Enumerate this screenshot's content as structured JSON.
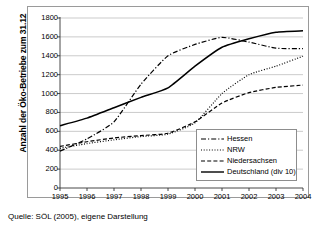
{
  "chart_data": {
    "type": "line",
    "title": "",
    "xlabel": "",
    "ylabel": "Anzahl der Öko-Betriebe zum 31.12",
    "x": [
      "1995",
      "1996",
      "1997",
      "1998",
      "1999",
      "2000",
      "2001",
      "2002",
      "2003",
      "2004"
    ],
    "categories": [
      "1995",
      "1996",
      "1997",
      "1998",
      "1999",
      "2000",
      "2001",
      "2002",
      "2003",
      "2004"
    ],
    "ylim": [
      0,
      1800
    ],
    "yticks": [
      "0",
      "200",
      "400",
      "600",
      "800",
      "1000",
      "1200",
      "1400",
      "1600",
      "1800"
    ],
    "grid": true,
    "legend_position": "lower-right",
    "series": [
      {
        "name": "Hessen",
        "style": "dash-dot",
        "color": "#000000",
        "values": [
          390,
          520,
          700,
          1100,
          1400,
          1520,
          1595,
          1545,
          1480,
          1475
        ]
      },
      {
        "name": "NRW",
        "style": "dotted",
        "color": "#000000",
        "values": [
          420,
          470,
          510,
          545,
          570,
          690,
          1000,
          1200,
          1290,
          1395
        ]
      },
      {
        "name": "Niedersachsen",
        "style": "dashed",
        "color": "#000000",
        "values": [
          440,
          490,
          530,
          555,
          580,
          700,
          900,
          1010,
          1065,
          1090
        ]
      },
      {
        "name": "Deutschland (div 10)",
        "style": "solid",
        "color": "#000000",
        "values": [
          660,
          740,
          850,
          960,
          1060,
          1290,
          1490,
          1580,
          1650,
          1665
        ]
      }
    ]
  },
  "legend": {
    "items": [
      {
        "label": "Hessen",
        "style": "dash-dot"
      },
      {
        "label": "NRW",
        "style": "dotted"
      },
      {
        "label": "Niedersachsen",
        "style": "dashed"
      },
      {
        "label": "Deutschland (div 10)",
        "style": "solid"
      }
    ]
  },
  "caption": {
    "text": "Quelle: SÖL (2005), eigene Darstellung"
  },
  "colors": {
    "line": "#000000",
    "grid": "#b5b5b5",
    "frame": "#9a9a9a",
    "background": "#ffffff"
  }
}
